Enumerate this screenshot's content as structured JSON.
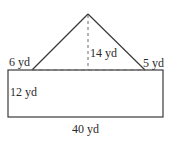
{
  "figure": {
    "type": "composite-shape",
    "stroke_color": "#3a3a3a",
    "dashed_color": "#6a6a6a",
    "labels": {
      "left_segment": "6 yd",
      "triangle_height": "14 yd",
      "right_segment": "5 yd",
      "rectangle_height": "12 yd",
      "rectangle_width": "40 yd"
    }
  }
}
